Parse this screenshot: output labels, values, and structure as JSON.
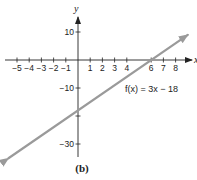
{
  "chart_data": {
    "type": "line",
    "title": "",
    "xlabel": "x",
    "ylabel": "y",
    "xlim": [
      -6,
      9
    ],
    "ylim": [
      -35,
      15
    ],
    "grid": false,
    "x_ticks": [
      -5,
      -4,
      -3,
      -2,
      -1,
      1,
      2,
      3,
      4,
      6,
      7,
      8
    ],
    "x_tick_labels": [
      "−5",
      "−4",
      "−3",
      "−2",
      "−1",
      "1",
      "2",
      "3",
      "4",
      "6",
      "7",
      "8"
    ],
    "y_ticks": [
      10,
      -10,
      -20,
      -30
    ],
    "y_tick_labels": [
      "10",
      "−10",
      "",
      "−30"
    ],
    "series": [
      {
        "name": "f(x) = 3x − 18",
        "equation": "f(x) = 3x - 18",
        "slope": 3,
        "intercept": -18,
        "x_intercept": 6,
        "x": [
          -5.7,
          9.0
        ],
        "y": [
          -35.1,
          9.0
        ],
        "color": "#9a9a9a",
        "arrows": "both"
      }
    ],
    "annotations": [
      {
        "text": "f(x) = 3x − 18",
        "x": 5.2,
        "y": -13
      }
    ],
    "caption": "(b)"
  },
  "labels": {
    "x_axis": "x",
    "y_axis": "y",
    "function": "f(x) = 3x − 18",
    "caption": "(b)"
  }
}
